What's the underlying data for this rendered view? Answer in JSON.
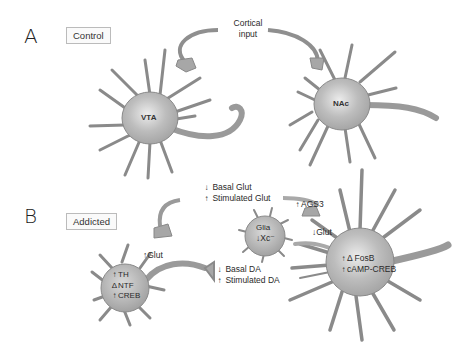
{
  "panels": {
    "a": {
      "letter": "A",
      "label": "Control",
      "cortical_input": {
        "line1": "Cortical",
        "line2": "input"
      },
      "cells": {
        "vta": "VTA",
        "nac": "NAc"
      }
    },
    "b": {
      "letter": "B",
      "label": "Addicted",
      "glut_inputs": [
        {
          "arrow": "↓",
          "text": "Basal Glut"
        },
        {
          "arrow": "↑",
          "text": "Stimulated Glut"
        }
      ],
      "ags3": {
        "arrow": "↑",
        "text": "AGS3"
      },
      "glia": {
        "name": "Glia",
        "arrow": "↓",
        "text": "Xc⁻"
      },
      "glut_to_nac": {
        "arrow": "↓",
        "text": "Glut"
      },
      "glut_to_vta": {
        "arrow": "↑",
        "text": "Glut"
      },
      "vta_markers": [
        {
          "arrow": "↑",
          "text": "TH"
        },
        {
          "arrow": "Δ",
          "text": "NTF"
        },
        {
          "arrow": "↑",
          "text": "CREB"
        }
      ],
      "da_outputs": [
        {
          "arrow": "↓",
          "text": "Basal DA"
        },
        {
          "arrow": "↑",
          "text": "Stimulated DA"
        }
      ],
      "nac_markers": [
        {
          "arrow": "↑",
          "text": "Δ FosB"
        },
        {
          "arrow": "↑",
          "text": "cAMP-CREB"
        }
      ]
    }
  },
  "colors": {
    "cell_fill": "#a9a9a9",
    "cell_highlight": "#e6e6e6",
    "cell_stroke": "#777777",
    "text": "#2a2a2a"
  }
}
